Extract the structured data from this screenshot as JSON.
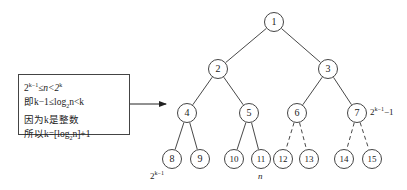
{
  "diagram": {
    "type": "complete-binary-tree",
    "nodes": [
      {
        "id": "1",
        "x": 274,
        "y": 22
      },
      {
        "id": "2",
        "x": 218,
        "y": 69
      },
      {
        "id": "3",
        "x": 328,
        "y": 69
      },
      {
        "id": "4",
        "x": 187,
        "y": 113
      },
      {
        "id": "5",
        "x": 249,
        "y": 113
      },
      {
        "id": "6",
        "x": 297,
        "y": 113
      },
      {
        "id": "7",
        "x": 357,
        "y": 113
      },
      {
        "id": "8",
        "x": 172,
        "y": 159
      },
      {
        "id": "9",
        "x": 200,
        "y": 159
      },
      {
        "id": "10",
        "x": 234,
        "y": 159
      },
      {
        "id": "11",
        "x": 261,
        "y": 159
      },
      {
        "id": "12",
        "x": 283,
        "y": 159
      },
      {
        "id": "13",
        "x": 309,
        "y": 159
      },
      {
        "id": "14",
        "x": 344,
        "y": 159
      },
      {
        "id": "15",
        "x": 372,
        "y": 159
      }
    ],
    "edges": [
      {
        "from": "1",
        "to": "2",
        "style": "solid"
      },
      {
        "from": "1",
        "to": "3",
        "style": "solid"
      },
      {
        "from": "2",
        "to": "4",
        "style": "solid"
      },
      {
        "from": "2",
        "to": "5",
        "style": "solid"
      },
      {
        "from": "3",
        "to": "6",
        "style": "solid"
      },
      {
        "from": "3",
        "to": "7",
        "style": "solid"
      },
      {
        "from": "4",
        "to": "8",
        "style": "solid"
      },
      {
        "from": "4",
        "to": "9",
        "style": "solid"
      },
      {
        "from": "5",
        "to": "10",
        "style": "solid"
      },
      {
        "from": "5",
        "to": "11",
        "style": "solid"
      },
      {
        "from": "6",
        "to": "12",
        "style": "dashed"
      },
      {
        "from": "6",
        "to": "13",
        "style": "dashed"
      },
      {
        "from": "7",
        "to": "14",
        "style": "dashed"
      },
      {
        "from": "7",
        "to": "15",
        "style": "dashed"
      }
    ],
    "annotations": {
      "node7_label": {
        "base": "2",
        "sup": "k−1",
        "suffix": "−1"
      },
      "node8_label": {
        "base": "2",
        "sup": "k−1"
      },
      "node11_label": "n"
    },
    "textbox": {
      "line1": {
        "a": "2",
        "a_sup": "k−1",
        "mid": "≤n<2",
        "b_sup": "k"
      },
      "line2": {
        "prefix": "即k−1≤log",
        "sub": "2",
        "suffix": "n<k"
      },
      "line3": "因为k是整数",
      "line4": {
        "prefix": "所以k=[log",
        "sub": "2",
        "suffix": "n]+1"
      }
    }
  }
}
